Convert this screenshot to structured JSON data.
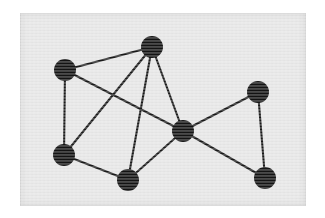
{
  "figure": {
    "kind": "undirected-graph-diagram",
    "width": 325,
    "height": 218,
    "page_background": "#ffffff"
  },
  "panel": {
    "x": 20,
    "y": 13,
    "width": 286,
    "height": 193,
    "background": "#e6e6e6",
    "border_color": "#d2d2d2"
  },
  "style": {
    "node_fill": "#141414",
    "node_radius": 11,
    "edge_color": "#1a1a1a",
    "edge_width": 2.1
  },
  "chart_data": {
    "type": "scatter",
    "title": "",
    "xlabel": "",
    "ylabel": "",
    "nodes": [
      {
        "id": "n1",
        "label": "top-left",
        "x": 65,
        "y": 70
      },
      {
        "id": "n2",
        "label": "top",
        "x": 152,
        "y": 47
      },
      {
        "id": "n3",
        "label": "top-right",
        "x": 258,
        "y": 92
      },
      {
        "id": "n4",
        "label": "center",
        "x": 183,
        "y": 131
      },
      {
        "id": "n5",
        "label": "bottom-left",
        "x": 64,
        "y": 155
      },
      {
        "id": "n6",
        "label": "bottom-mid",
        "x": 128,
        "y": 180
      },
      {
        "id": "n7",
        "label": "bottom-right",
        "x": 265,
        "y": 178
      }
    ],
    "edges": [
      {
        "source": "n1",
        "target": "n2"
      },
      {
        "source": "n1",
        "target": "n5"
      },
      {
        "source": "n1",
        "target": "n4"
      },
      {
        "source": "n2",
        "target": "n5"
      },
      {
        "source": "n2",
        "target": "n6"
      },
      {
        "source": "n2",
        "target": "n4"
      },
      {
        "source": "n3",
        "target": "n4"
      },
      {
        "source": "n3",
        "target": "n7"
      },
      {
        "source": "n4",
        "target": "n6"
      },
      {
        "source": "n4",
        "target": "n7"
      },
      {
        "source": "n5",
        "target": "n6"
      }
    ],
    "node_count": 7,
    "edge_count": 11
  }
}
